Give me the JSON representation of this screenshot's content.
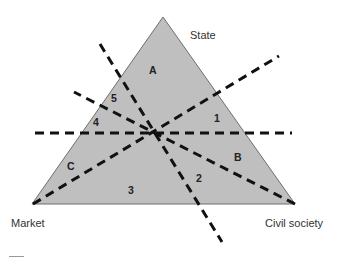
{
  "diagram": {
    "type": "welfare-triangle",
    "colors": {
      "triangle_fill": "#bfbfbf",
      "triangle_stroke": "#6e6e6e",
      "dash_line": "#111111",
      "label_text": "#333333"
    },
    "vertices": {
      "top": "State",
      "bottom_left": "Market",
      "bottom_right": "Civil society"
    },
    "regions": {
      "A": "A",
      "B": "B",
      "C": "C",
      "n1": "1",
      "n2": "2",
      "n3": "3",
      "n4": "4",
      "n5": "5"
    }
  }
}
